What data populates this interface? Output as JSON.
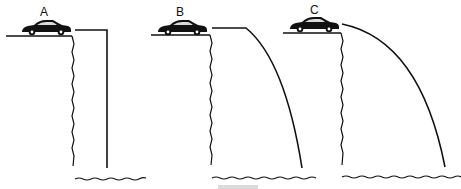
{
  "figure": {
    "panels": [
      {
        "label": "A",
        "trajectory": "horizontal-then-vertical"
      },
      {
        "label": "B",
        "trajectory": "horizontal-then-curved"
      },
      {
        "label": "C",
        "trajectory": "parabolic"
      }
    ],
    "colors": {
      "ink": "#111111",
      "background": "#ffffff"
    }
  }
}
